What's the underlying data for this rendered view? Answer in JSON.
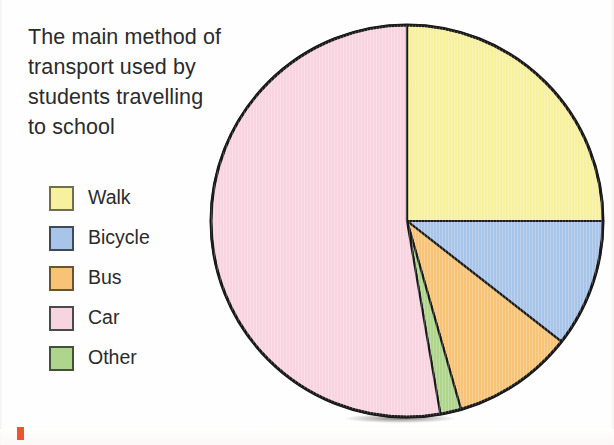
{
  "chart_data": {
    "type": "pie",
    "title": "The main method of transport used by students travelling to school",
    "categories": [
      "Walk",
      "Bicycle",
      "Bus",
      "Car",
      "Other"
    ],
    "values": [
      25,
      10.5,
      10,
      52.8,
      1.7
    ],
    "angles_deg": [
      90,
      38,
      36,
      190,
      6
    ],
    "colors": [
      "#F7F09E",
      "#A8C4E8",
      "#F7C477",
      "#F8D3E0",
      "#AFD58D"
    ],
    "start_angle_deg": 0,
    "direction": "clockwise",
    "legend_position": "left",
    "xlabel": "",
    "ylabel": "",
    "grid": false
  },
  "title": {
    "line1": "The main method of",
    "line2": "transport used by",
    "line3": "students travelling",
    "line4": "to school",
    "full": "The main method of transport used by students travelling to school"
  },
  "legend": {
    "items": [
      {
        "label": "Walk",
        "color": "#F7F09E",
        "border": "#6E6E50"
      },
      {
        "label": "Bicycle",
        "color": "#A8C4E8",
        "border": "#3E4A5A"
      },
      {
        "label": "Bus",
        "color": "#F7C477",
        "border": "#6B5433"
      },
      {
        "label": "Car",
        "color": "#F8D3E0",
        "border": "#4A4A4A"
      },
      {
        "label": "Other",
        "color": "#AFD58D",
        "border": "#44503A"
      }
    ]
  },
  "pie": {
    "outline_color": "#1a1a1a",
    "slices": [
      {
        "name": "Walk",
        "color": "#F7F09E",
        "start": 0,
        "end": 90
      },
      {
        "name": "Bicycle",
        "color": "#A8C4E8",
        "start": 90,
        "end": 128
      },
      {
        "name": "Bus",
        "color": "#F7C477",
        "start": 128,
        "end": 164
      },
      {
        "name": "Other",
        "color": "#AFD58D",
        "start": 164,
        "end": 170.2
      },
      {
        "name": "Car",
        "color": "#F8D3E0",
        "start": 170.2,
        "end": 360
      }
    ]
  }
}
